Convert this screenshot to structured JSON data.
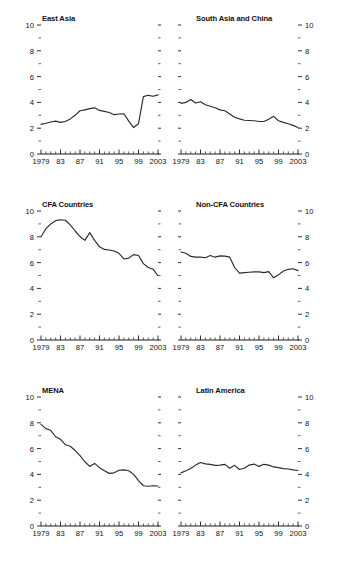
{
  "figure": {
    "width": 337,
    "height": 564,
    "panel_count": 6
  },
  "axis": {
    "y_major_labels": [
      "0",
      "2",
      "4",
      "6",
      "8",
      "10"
    ],
    "y_major_values": [
      0,
      2,
      4,
      6,
      8,
      10
    ],
    "y_minor_values": [
      1,
      3,
      5,
      7,
      9
    ],
    "x_labels": [
      "1979",
      "83",
      "87",
      "91",
      "95",
      "99",
      "2003"
    ],
    "x_label_years": [
      1979,
      1983,
      1987,
      1991,
      1995,
      1999,
      2003
    ],
    "x_tick_years_all": [
      1979,
      1980,
      1981,
      1982,
      1983,
      1984,
      1985,
      1986,
      1987,
      1988,
      1989,
      1990,
      1991,
      1992,
      1993,
      1994,
      1995,
      1996,
      1997,
      1998,
      1999,
      2000,
      2001,
      2002,
      2003
    ],
    "ylim": [
      0,
      10
    ],
    "xlim": [
      1979,
      2003
    ]
  },
  "colors": {
    "line": "#2b2b2b",
    "axis": "#1a1a1a",
    "text": "#111111",
    "background": "#ffffff"
  },
  "chart_data": [
    {
      "type": "line",
      "title": "East Asia",
      "xlabel": "",
      "ylabel": "",
      "ylim": [
        0,
        10
      ],
      "grid": false,
      "legend": "none",
      "x": [
        1979,
        1980,
        1981,
        1982,
        1983,
        1984,
        1985,
        1986,
        1987,
        1988,
        1989,
        1990,
        1991,
        1992,
        1993,
        1994,
        1995,
        1996,
        1997,
        1998,
        1999,
        2000,
        2001,
        2002,
        2003
      ],
      "values": [
        2.3,
        2.38,
        2.48,
        2.55,
        2.45,
        2.52,
        2.72,
        3.0,
        3.35,
        3.42,
        3.52,
        3.58,
        3.38,
        3.3,
        3.22,
        3.05,
        3.1,
        3.12,
        2.55,
        2.05,
        2.35,
        4.45,
        4.55,
        4.48,
        4.58,
        4.55
      ],
      "y_axis_side": "left",
      "label_side": "left"
    },
    {
      "type": "line",
      "title": "South Asia and China",
      "xlabel": "",
      "ylabel": "",
      "ylim": [
        0,
        10
      ],
      "grid": false,
      "legend": "none",
      "x": [
        1979,
        1980,
        1981,
        1982,
        1983,
        1984,
        1985,
        1986,
        1987,
        1988,
        1989,
        1990,
        1991,
        1992,
        1993,
        1994,
        1995,
        1996,
        1997,
        1998,
        1999,
        2000,
        2001,
        2002,
        2003
      ],
      "values": [
        3.92,
        4.0,
        4.22,
        3.95,
        4.05,
        3.82,
        3.7,
        3.58,
        3.42,
        3.35,
        3.1,
        2.85,
        2.72,
        2.62,
        2.6,
        2.58,
        2.52,
        2.52,
        2.7,
        2.92,
        2.58,
        2.45,
        2.35,
        2.22,
        2.05
      ],
      "y_axis_side": "right",
      "label_side": "right"
    },
    {
      "type": "line",
      "title": "CFA Countries",
      "xlabel": "",
      "ylabel": "",
      "ylim": [
        0,
        10
      ],
      "grid": false,
      "legend": "none",
      "x": [
        1979,
        1980,
        1981,
        1982,
        1983,
        1984,
        1985,
        1986,
        1987,
        1988,
        1989,
        1990,
        1991,
        1992,
        1993,
        1994,
        1995,
        1996,
        1997,
        1998,
        1999,
        2000,
        2001,
        2002,
        2003
      ],
      "values": [
        8.0,
        8.62,
        9.0,
        9.25,
        9.32,
        9.28,
        8.92,
        8.45,
        8.02,
        7.72,
        8.32,
        7.72,
        7.22,
        7.02,
        6.98,
        6.9,
        6.72,
        6.28,
        6.35,
        6.62,
        6.55,
        5.92,
        5.62,
        5.48,
        4.98,
        4.18
      ],
      "y_axis_side": "left",
      "label_side": "left"
    },
    {
      "type": "line",
      "title": "Non-CFA Countries",
      "xlabel": "",
      "ylabel": "",
      "ylim": [
        0,
        10
      ],
      "grid": false,
      "legend": "none",
      "x": [
        1979,
        1980,
        1981,
        1982,
        1983,
        1984,
        1985,
        1986,
        1987,
        1988,
        1989,
        1990,
        1991,
        1992,
        1993,
        1994,
        1995,
        1996,
        1997,
        1998,
        1999,
        2000,
        2001,
        2002,
        2003
      ],
      "values": [
        6.82,
        6.72,
        6.48,
        6.42,
        6.42,
        6.38,
        6.55,
        6.42,
        6.52,
        6.5,
        6.42,
        5.62,
        5.18,
        5.22,
        5.25,
        5.28,
        5.28,
        5.22,
        5.3,
        4.82,
        5.05,
        5.35,
        5.48,
        5.52,
        5.38
      ],
      "y_axis_side": "right",
      "label_side": "right"
    },
    {
      "type": "line",
      "title": "MENA",
      "xlabel": "",
      "ylabel": "",
      "ylim": [
        0,
        10
      ],
      "grid": false,
      "legend": "none",
      "x": [
        1979,
        1980,
        1981,
        1982,
        1983,
        1984,
        1985,
        1986,
        1987,
        1988,
        1989,
        1990,
        1991,
        1992,
        1993,
        1994,
        1995,
        1996,
        1997,
        1998,
        1999,
        2000,
        2001,
        2002,
        2003
      ],
      "values": [
        7.88,
        7.55,
        7.42,
        6.92,
        6.72,
        6.3,
        6.18,
        5.85,
        5.45,
        4.98,
        4.62,
        4.85,
        4.52,
        4.28,
        4.08,
        4.12,
        4.32,
        4.35,
        4.28,
        4.0,
        3.52,
        3.12,
        3.08,
        3.12,
        3.1
      ],
      "y_axis_side": "left",
      "label_side": "left"
    },
    {
      "type": "line",
      "title": "Latin America",
      "xlabel": "",
      "ylabel": "",
      "ylim": [
        0,
        10
      ],
      "grid": false,
      "legend": "none",
      "x": [
        1979,
        1980,
        1981,
        1982,
        1983,
        1984,
        1985,
        1986,
        1987,
        1988,
        1989,
        1990,
        1991,
        1992,
        1993,
        1994,
        1995,
        1996,
        1997,
        1998,
        1999,
        2000,
        2001,
        2002,
        2003
      ],
      "values": [
        4.12,
        4.28,
        4.45,
        4.72,
        4.92,
        4.82,
        4.78,
        4.7,
        4.72,
        4.78,
        4.48,
        4.7,
        4.38,
        4.48,
        4.72,
        4.8,
        4.62,
        4.78,
        4.72,
        4.58,
        4.52,
        4.45,
        4.42,
        4.35,
        4.3
      ],
      "y_axis_side": "right",
      "label_side": "right"
    }
  ]
}
